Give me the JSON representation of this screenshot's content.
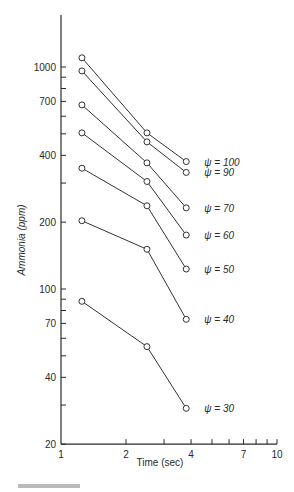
{
  "chart_data": {
    "type": "line",
    "title": "",
    "xlabel": "Time (sec)",
    "ylabel": "Ammonia (ppm)",
    "xscale": "log",
    "yscale": "log",
    "xlim": [
      1,
      10
    ],
    "ylim": [
      20,
      1500
    ],
    "x_ticks": [
      1,
      2,
      4,
      7,
      10
    ],
    "y_ticks": [
      20,
      40,
      70,
      100,
      200,
      400,
      700,
      1000
    ],
    "grid": false,
    "legend_position": "inline-right",
    "x": [
      1.25,
      2.5,
      3.8
    ],
    "series": [
      {
        "name": "ψ = 100",
        "values": [
          1100,
          505,
          375
        ]
      },
      {
        "name": "ψ = 90",
        "values": [
          960,
          460,
          335
        ]
      },
      {
        "name": "ψ = 70",
        "values": [
          675,
          370,
          232
        ]
      },
      {
        "name": "ψ = 60",
        "values": [
          505,
          305,
          175
        ]
      },
      {
        "name": "ψ = 50",
        "values": [
          350,
          237,
          123
        ]
      },
      {
        "name": "ψ = 40",
        "values": [
          203,
          151,
          73
        ]
      },
      {
        "name": "ψ = 30",
        "values": [
          88,
          55,
          29
        ]
      }
    ]
  },
  "axes": {
    "xlabel": "Time (sec)",
    "ylabel": "Ammonia (ppm)"
  }
}
